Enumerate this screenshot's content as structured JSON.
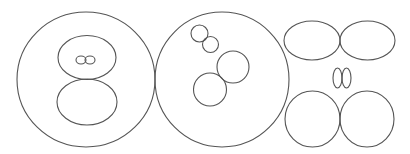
{
  "diagram": {
    "width": 410,
    "height": 154,
    "background": "#ffffff",
    "stroke_color": "#555555",
    "groups": [
      {
        "name": "left-group",
        "shapes": [
          {
            "name": "outer-circle",
            "type": "ellipse",
            "cx": 86,
            "cy": 79.5,
            "rx": 69,
            "ry": 67.5
          },
          {
            "name": "upper-inner-ellipse",
            "type": "ellipse",
            "cx": 87,
            "cy": 57.5,
            "rx": 29,
            "ry": 22
          },
          {
            "name": "lower-inner-ellipse",
            "type": "ellipse",
            "cx": 87,
            "cy": 102,
            "rx": 30,
            "ry": 23
          },
          {
            "name": "tiny-ellipse-left",
            "type": "ellipse",
            "cx": 81,
            "cy": 60,
            "rx": 5,
            "ry": 4
          },
          {
            "name": "tiny-ellipse-right",
            "type": "ellipse",
            "cx": 90,
            "cy": 60,
            "rx": 5,
            "ry": 4
          }
        ]
      },
      {
        "name": "middle-group",
        "shapes": [
          {
            "name": "outer-circle",
            "type": "ellipse",
            "cx": 222,
            "cy": 79.5,
            "rx": 67,
            "ry": 67.5
          },
          {
            "name": "small-circle-a",
            "type": "ellipse",
            "cx": 199.5,
            "cy": 33.5,
            "rx": 8.5,
            "ry": 8.5
          },
          {
            "name": "small-circle-b",
            "type": "ellipse",
            "cx": 210.5,
            "cy": 44.5,
            "rx": 8,
            "ry": 8
          },
          {
            "name": "medium-circle-upper",
            "type": "ellipse",
            "cx": 233,
            "cy": 67,
            "rx": 16,
            "ry": 16
          },
          {
            "name": "medium-circle-lower",
            "type": "ellipse",
            "cx": 210,
            "cy": 89.5,
            "rx": 16.5,
            "ry": 16.5
          }
        ]
      },
      {
        "name": "right-group",
        "shapes": [
          {
            "name": "top-ellipse-left",
            "type": "ellipse",
            "cx": 312,
            "cy": 40.5,
            "rx": 28,
            "ry": 19.5
          },
          {
            "name": "top-ellipse-right",
            "type": "ellipse",
            "cx": 367.5,
            "cy": 40.5,
            "rx": 27.5,
            "ry": 19.5
          },
          {
            "name": "small-ellipse-left",
            "type": "ellipse",
            "cx": 337.5,
            "cy": 78,
            "rx": 4.5,
            "ry": 10
          },
          {
            "name": "small-ellipse-right",
            "type": "ellipse",
            "cx": 346.5,
            "cy": 78,
            "rx": 4.5,
            "ry": 10
          },
          {
            "name": "bottom-circle-left",
            "type": "ellipse",
            "cx": 312.5,
            "cy": 119,
            "rx": 27.5,
            "ry": 28
          },
          {
            "name": "bottom-circle-right",
            "type": "ellipse",
            "cx": 367,
            "cy": 119,
            "rx": 27,
            "ry": 28
          }
        ]
      }
    ]
  }
}
